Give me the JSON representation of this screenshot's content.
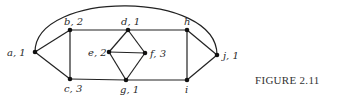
{
  "figure": {
    "caption": "FIGURE 2.11",
    "nodes": [
      {
        "id": "a",
        "label": "a, 1",
        "x": 35,
        "y": 52,
        "lx": 7,
        "ly": 56
      },
      {
        "id": "b",
        "label": "b, 2",
        "x": 70,
        "y": 30,
        "lx": 64,
        "ly": 25
      },
      {
        "id": "c",
        "label": "c, 3",
        "x": 70,
        "y": 79,
        "lx": 64,
        "ly": 92
      },
      {
        "id": "d",
        "label": "d, 1",
        "x": 128,
        "y": 30,
        "lx": 121,
        "ly": 25
      },
      {
        "id": "e",
        "label": "e, 2",
        "x": 109,
        "y": 52,
        "lx": 88,
        "ly": 56
      },
      {
        "id": "f",
        "label": "f, 3",
        "x": 145,
        "y": 53,
        "lx": 150,
        "ly": 57
      },
      {
        "id": "g",
        "label": "g, 1",
        "x": 126,
        "y": 80,
        "lx": 120,
        "ly": 93
      },
      {
        "id": "h",
        "label": "h",
        "x": 187,
        "y": 30,
        "lx": 184,
        "ly": 25
      },
      {
        "id": "i",
        "label": "i",
        "x": 187,
        "y": 80,
        "lx": 185,
        "ly": 93
      },
      {
        "id": "j",
        "label": "j, 1",
        "x": 217,
        "y": 55,
        "lx": 223,
        "ly": 59
      }
    ],
    "edges": [
      [
        "a",
        "b"
      ],
      [
        "a",
        "c"
      ],
      [
        "b",
        "c"
      ],
      [
        "b",
        "d"
      ],
      [
        "d",
        "h"
      ],
      [
        "c",
        "g"
      ],
      [
        "g",
        "i"
      ],
      [
        "d",
        "e"
      ],
      [
        "d",
        "f"
      ],
      [
        "e",
        "f"
      ],
      [
        "e",
        "g"
      ],
      [
        "f",
        "g"
      ],
      [
        "h",
        "i"
      ],
      [
        "h",
        "j"
      ],
      [
        "i",
        "j"
      ]
    ],
    "arc": {
      "from": "a",
      "to": "j",
      "path": "M35,52 C35,-10 217,-10 217,55"
    }
  }
}
